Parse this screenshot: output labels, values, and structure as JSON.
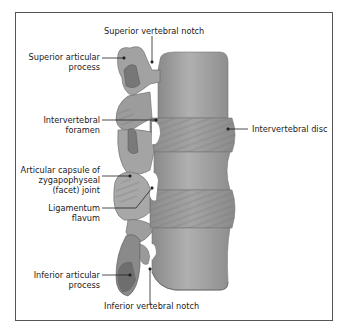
{
  "diagram": {
    "colors": {
      "bone": "#9a9a9a",
      "bone_light": "#b4b4b4",
      "bone_dark": "#6e6e6e",
      "disc": "#8c8c8c",
      "leader": "#222222",
      "border": "#555555"
    },
    "labels": {
      "superior_vertebral_notch": "Superior vertebral notch",
      "superior_articular_process_1": "Superior articular",
      "superior_articular_process_2": "process",
      "intervertebral_foramen_1": "Intervertebral",
      "intervertebral_foramen_2": "foramen",
      "intervertebral_disc": "Intervertebral disc",
      "articular_capsule_1": "Articular capsule of",
      "articular_capsule_2": "zygapophyseal",
      "articular_capsule_3": "(facet) joint",
      "ligamentum_flavum_1": "Ligamentum",
      "ligamentum_flavum_2": "flavum",
      "inferior_articular_process_1": "Inferior articular",
      "inferior_articular_process_2": "process",
      "inferior_vertebral_notch": "Inferior vertebral notch"
    }
  }
}
